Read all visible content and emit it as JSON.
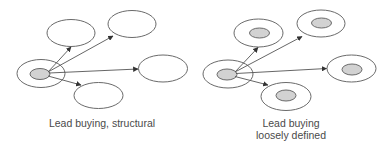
{
  "panels": [
    {
      "id": "structural",
      "caption": "Lead buying, structural",
      "caption_lines": [
        "Lead buying, structural"
      ],
      "source": {
        "label": "lead buyer",
        "outer": true,
        "inner": true
      },
      "targets": [
        {
          "name": "top-left",
          "inner": false
        },
        {
          "name": "top-right",
          "inner": false
        },
        {
          "name": "right",
          "inner": false
        },
        {
          "name": "bottom",
          "inner": false
        }
      ]
    },
    {
      "id": "loosely-defined",
      "caption": "Lead buying loosely defined",
      "caption_lines": [
        "Lead buying",
        "loosely defined"
      ],
      "source": {
        "label": "lead buyer",
        "outer": true,
        "inner": true
      },
      "targets": [
        {
          "name": "top-left",
          "inner": true
        },
        {
          "name": "top-right",
          "inner": true
        },
        {
          "name": "right",
          "inner": true
        },
        {
          "name": "bottom",
          "inner": true
        }
      ]
    }
  ],
  "colors": {
    "stroke": "#6a6a6a",
    "inner_fill": "#d2d2d2",
    "text": "#4a4a4a",
    "background": "#ffffff"
  }
}
